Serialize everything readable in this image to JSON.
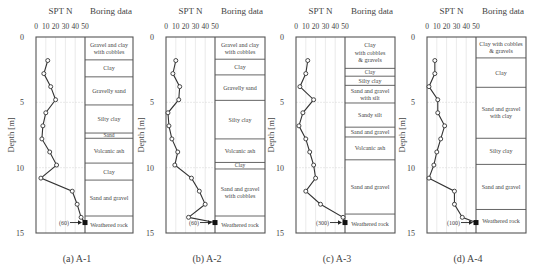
{
  "figure": {
    "common": {
      "spt_axis_title": "SPT N",
      "boring_title": "Boring data",
      "depth_label": "Depth [m]",
      "x_ticks": [
        0,
        10,
        20,
        30,
        40,
        50
      ],
      "y_ticks": [
        0,
        5,
        10,
        15
      ],
      "xlim": [
        0,
        50
      ],
      "ylim": [
        0,
        15
      ]
    },
    "panels": [
      {
        "caption": "(a) A-1",
        "refusal_label": "(60)"
      },
      {
        "caption": "(b) A-2",
        "refusal_label": "(60)"
      },
      {
        "caption": "(c) A-3",
        "refusal_label": "(300)"
      },
      {
        "caption": "(d) A-4",
        "refusal_label": "(100)"
      }
    ]
  },
  "chart_data": [
    {
      "type": "line",
      "title": "(a) A-1",
      "xlabel": "SPT N",
      "ylabel": "Depth [m]",
      "xlim": [
        0,
        50
      ],
      "ylim": [
        15,
        0
      ],
      "grid": true,
      "spt": {
        "depth": [
          1.8,
          2.8,
          3.8,
          4.8,
          5.8,
          6.8,
          7.8,
          8.8,
          9.8,
          10.8,
          11.8,
          12.8,
          13.8,
          14.2
        ],
        "n": [
          12,
          8,
          15,
          20,
          10,
          7,
          6,
          14,
          21,
          5,
          37,
          42,
          46,
          50
        ],
        "refusal_value": 60
      },
      "layers": [
        {
          "name": "Gravel and clay with cobbles",
          "top": 0,
          "bottom": 1.75
        },
        {
          "name": "Clay",
          "top": 1.75,
          "bottom": 3.05
        },
        {
          "name": "Gravelly sand",
          "top": 3.05,
          "bottom": 5.2
        },
        {
          "name": "Silty clay",
          "top": 5.2,
          "bottom": 7.35
        },
        {
          "name": "Sand",
          "top": 7.35,
          "bottom": 7.75
        },
        {
          "name": "Volcanic ash",
          "top": 7.75,
          "bottom": 9.65
        },
        {
          "name": "Clay",
          "top": 9.65,
          "bottom": 10.95
        },
        {
          "name": "Sand and gravel",
          "top": 10.95,
          "bottom": 13.7
        },
        {
          "name": "Weathered rock",
          "top": 13.7,
          "bottom": 15
        }
      ]
    },
    {
      "type": "line",
      "title": "(b) A-2",
      "xlabel": "SPT N",
      "ylabel": "Depth [m]",
      "xlim": [
        0,
        50
      ],
      "ylim": [
        15,
        0
      ],
      "grid": true,
      "spt": {
        "depth": [
          1.8,
          2.8,
          3.8,
          4.8,
          5.8,
          6.8,
          7.8,
          8.8,
          9.8,
          10.8,
          11.8,
          12.8,
          13.8,
          14.2
        ],
        "n": [
          10,
          7,
          14,
          13,
          2,
          3,
          6,
          12,
          9,
          26,
          34,
          40,
          23,
          50
        ],
        "refusal_value": 60
      },
      "layers": [
        {
          "name": "Gravel and clay with cobbles",
          "top": 0,
          "bottom": 1.7
        },
        {
          "name": "Clay",
          "top": 1.7,
          "bottom": 2.9
        },
        {
          "name": "Gravelly sand",
          "top": 2.9,
          "bottom": 4.85
        },
        {
          "name": "Silty clay",
          "top": 4.85,
          "bottom": 7.8
        },
        {
          "name": "Volcanic ash",
          "top": 7.8,
          "bottom": 9.6
        },
        {
          "name": "Clay",
          "top": 9.6,
          "bottom": 10.1
        },
        {
          "name": "Sand and gravel with cobbles",
          "top": 10.1,
          "bottom": 13.7
        },
        {
          "name": "Weathered rock",
          "top": 13.7,
          "bottom": 15
        }
      ]
    },
    {
      "type": "line",
      "title": "(c) A-3",
      "xlabel": "SPT N",
      "ylabel": "Depth [m]",
      "xlim": [
        0,
        50
      ],
      "ylim": [
        15,
        0
      ],
      "grid": true,
      "spt": {
        "depth": [
          1.8,
          2.8,
          3.8,
          4.8,
          5.8,
          6.8,
          7.8,
          8.8,
          9.8,
          10.8,
          11.8,
          12.8,
          13.8,
          14.2
        ],
        "n": [
          12,
          10,
          4,
          18,
          7,
          3,
          10,
          14,
          18,
          20,
          10,
          25,
          48,
          50
        ],
        "refusal_value": 300
      },
      "layers": [
        {
          "name": "Clay with cobbles & gravels",
          "top": 0,
          "bottom": 2.4
        },
        {
          "name": "Clay",
          "top": 2.4,
          "bottom": 3.0
        },
        {
          "name": "Silty clay",
          "top": 3.0,
          "bottom": 3.7
        },
        {
          "name": "Sand and gravel with silt",
          "top": 3.7,
          "bottom": 5.05
        },
        {
          "name": "Sandy silt",
          "top": 5.05,
          "bottom": 6.9
        },
        {
          "name": "Sand and gravel",
          "top": 6.9,
          "bottom": 7.65
        },
        {
          "name": "Volcanic ash",
          "top": 7.65,
          "bottom": 9.4
        },
        {
          "name": "Sand and gravel",
          "top": 9.4,
          "bottom": 13.55
        },
        {
          "name": "Weathered rock",
          "top": 13.55,
          "bottom": 15
        }
      ]
    },
    {
      "type": "line",
      "title": "(d) A-4",
      "xlabel": "SPT N",
      "ylabel": "Depth [m]",
      "xlim": [
        0,
        50
      ],
      "ylim": [
        15,
        0
      ],
      "grid": true,
      "spt": {
        "depth": [
          1.8,
          2.8,
          3.8,
          4.8,
          5.8,
          6.8,
          7.8,
          8.8,
          9.8,
          10.8,
          11.8,
          12.8,
          13.8,
          14.2
        ],
        "n": [
          8,
          8,
          2,
          11,
          11,
          18,
          14,
          10,
          7,
          2,
          28,
          28,
          36,
          50
        ],
        "refusal_value": 100
      },
      "layers": [
        {
          "name": "Clay with cobbles & gravels",
          "top": 0,
          "bottom": 1.6
        },
        {
          "name": "Clay",
          "top": 1.6,
          "bottom": 3.85
        },
        {
          "name": "Sand and gravel with clay",
          "top": 3.85,
          "bottom": 7.75
        },
        {
          "name": "Silty clay",
          "top": 7.75,
          "bottom": 9.75
        },
        {
          "name": "Sand and gravel",
          "top": 9.75,
          "bottom": 13.2
        },
        {
          "name": "Weathered rock",
          "top": 13.2,
          "bottom": 15
        }
      ]
    }
  ]
}
